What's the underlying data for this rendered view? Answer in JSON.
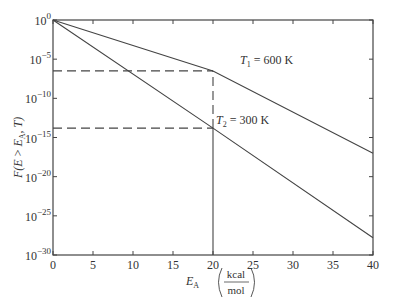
{
  "chart_data": {
    "type": "line",
    "title": "",
    "xlabel": "E_A",
    "xlabel_unit_num": "kcal",
    "xlabel_unit_den": "mol",
    "ylabel": "F(E > E_A, T)",
    "xlim": [
      0,
      40
    ],
    "ylim_log10": [
      -30,
      0
    ],
    "y_scale": "log",
    "grid": false,
    "x_ticks": [
      0,
      5,
      10,
      15,
      20,
      25,
      30,
      35,
      40
    ],
    "y_ticks_log10": [
      0,
      -5,
      -10,
      -15,
      -20,
      -25,
      -30
    ],
    "y_tick_labels": [
      "10^0",
      "10^-5",
      "10^-10",
      "10^-15",
      "10^-20",
      "10^-25",
      "10^-30"
    ],
    "series": [
      {
        "name": "T1 = 600 K",
        "label_sub": "1",
        "label_rest": " = 600 K",
        "x": [
          0,
          20,
          40
        ],
        "log10_y": [
          0,
          -6.5,
          -17
        ]
      },
      {
        "name": "T2 = 300 K",
        "label_sub": "2",
        "label_rest": " = 300 K",
        "x": [
          0,
          20,
          40
        ],
        "log10_y": [
          0,
          -13.8,
          -27.8
        ]
      }
    ],
    "annotations": [
      {
        "type": "dashed-hline",
        "log10_y": -6.5,
        "x_from": 0,
        "x_to": 20
      },
      {
        "type": "dashed-hline",
        "log10_y": -13.8,
        "x_from": 0,
        "x_to": 20
      },
      {
        "type": "dashed-vline",
        "x": 20,
        "log10_from": -13.8,
        "log10_to": -6.5
      },
      {
        "type": "solid-vline",
        "x": 20,
        "log10_from": -30,
        "log10_to": -13.8
      }
    ]
  }
}
